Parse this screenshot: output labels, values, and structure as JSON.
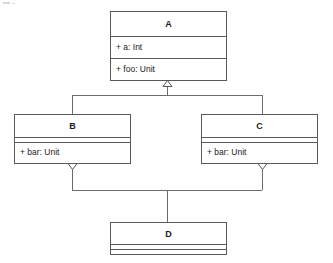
{
  "diagram": {
    "type": "uml-class-diagram",
    "title": "",
    "background_color": "#ffffff",
    "line_color": "#5a5a5a",
    "text_color": "#1a1a1a",
    "classes": [
      {
        "id": "A",
        "name": "A",
        "attributes": [
          "+ a: Int"
        ],
        "operations": [
          "+ foo: Unit"
        ]
      },
      {
        "id": "B",
        "name": "B",
        "attributes": [],
        "operations": [
          "+ bar: Unit"
        ]
      },
      {
        "id": "C",
        "name": "C",
        "attributes": [],
        "operations": [
          "+ bar: Unit"
        ]
      },
      {
        "id": "D",
        "name": "D",
        "attributes": [],
        "operations": []
      }
    ],
    "relationships": [
      {
        "type": "generalization",
        "from": "B",
        "to": "A"
      },
      {
        "type": "generalization",
        "from": "C",
        "to": "A"
      },
      {
        "type": "generalization",
        "from": "D",
        "to": "B"
      },
      {
        "type": "generalization",
        "from": "D",
        "to": "C"
      }
    ]
  }
}
